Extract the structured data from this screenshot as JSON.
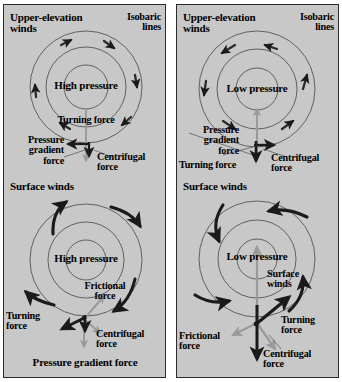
{
  "figure": {
    "type": "diagram",
    "panel_count": 2,
    "background_color": "#c8c8c8",
    "border_color": "#2b2b2b",
    "arrow_black": "#1a1a1a",
    "arrow_gray": "#9a9a9a",
    "isobar_color": "#555555"
  },
  "panels": [
    {
      "id": "left",
      "pressure_center": "High pressure",
      "circulation": "clockwise",
      "upper": {
        "title": "Upper-elevation\nwinds",
        "isobar_label": "Isobaric\nlines",
        "center_label": "High pressure",
        "labels": {
          "turning": "Turning force",
          "pressure_gradient": "Pressure\ngradient\nforce",
          "centrifugal": "Centrifugal\nforce"
        },
        "wind_arrow_count": 6
      },
      "surface": {
        "title": "Surface winds",
        "center_label": "High pressure",
        "labels": {
          "frictional": "Frictional\nforce",
          "turning": "Turning\nforce",
          "centrifugal": "Centrifugal\nforce",
          "pressure_gradient": "Pressure gradient force"
        },
        "wind_arrow_count": 4
      }
    },
    {
      "id": "right",
      "pressure_center": "Low pressure",
      "circulation": "counterclockwise",
      "upper": {
        "title": "Upper-elevation\nwinds",
        "isobar_label": "Isobaric\nlines",
        "center_label": "Low pressure",
        "labels": {
          "pressure_gradient": "Pressure\ngradient\nforce",
          "turning": "Turning force",
          "centrifugal": "Centrifugal\nforce"
        },
        "wind_arrow_count": 6
      },
      "surface": {
        "title": "Surface winds",
        "center_label": "Low pressure",
        "labels": {
          "surface_winds": "Surface\nwinds",
          "frictional": "Frictional\nforce",
          "turning": "Turning\nforce",
          "centrifugal": "Centrifugal\nforce"
        },
        "wind_arrow_count": 4
      }
    }
  ],
  "text": {
    "upper_elevation_winds_l1": "Upper-elevation",
    "upper_elevation_winds_l2": "winds",
    "isobaric_l1": "Isobaric",
    "isobaric_l2": "lines",
    "high_pressure": "High pressure",
    "low_pressure": "Low pressure",
    "turning_force_one_line": "Turning force",
    "turning_l1": "Turning",
    "turning_l2": "force",
    "pressure_l1": "Pressure",
    "pressure_l2": "gradient",
    "pressure_l3": "force",
    "centrifugal_l1": "Centrifugal",
    "centrifugal_l2": "force",
    "surface_winds": "Surface winds",
    "surface_l1": "Surface",
    "surface_l2": "winds",
    "frictional_l1": "Frictional",
    "frictional_l2": "force",
    "pressure_gradient_force": "Pressure gradient force"
  }
}
